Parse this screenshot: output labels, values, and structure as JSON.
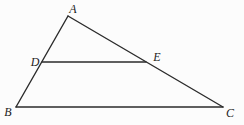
{
  "figure": {
    "type": "geometry-diagram",
    "background": "#fcfcfc",
    "line_color": "#2b2b2b",
    "label_color": "#1c1c1c",
    "line_width": 1.4,
    "width": 244,
    "height": 125,
    "points": {
      "A": {
        "x": 68,
        "y": 16,
        "label": "A",
        "label_x": 73,
        "label_y": 13
      },
      "B": {
        "x": 16,
        "y": 107,
        "label": "B",
        "label_x": 8,
        "label_y": 116
      },
      "C": {
        "x": 223,
        "y": 107,
        "label": "C",
        "label_x": 230,
        "label_y": 117
      },
      "D": {
        "x": 42,
        "y": 62,
        "label": "D",
        "label_x": 35,
        "label_y": 66
      },
      "E": {
        "x": 146,
        "y": 62,
        "label": "E",
        "label_x": 157,
        "label_y": 61
      }
    },
    "segments": [
      {
        "from": "A",
        "to": "B"
      },
      {
        "from": "A",
        "to": "C"
      },
      {
        "from": "B",
        "to": "C"
      },
      {
        "from": "D",
        "to": "E"
      }
    ]
  }
}
